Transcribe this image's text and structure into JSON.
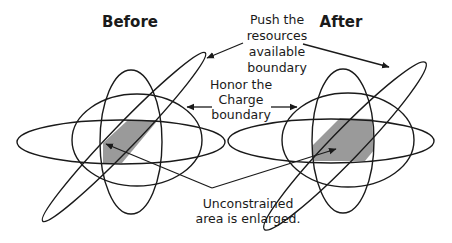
{
  "diagram": {
    "panels": [
      {
        "id": "before",
        "title": "Before"
      },
      {
        "id": "after",
        "title": "After"
      }
    ],
    "annotations": {
      "resources": [
        "Push the",
        "resources",
        "available",
        "boundary"
      ],
      "charge": [
        "Honor the",
        "Charge",
        "boundary"
      ],
      "unconstrained": [
        "Unconstrained",
        "area is enlarged."
      ]
    },
    "colors": {
      "line": "#1a1a1a",
      "shaded_region": "#9a9a9a",
      "background": "#ffffff"
    }
  }
}
